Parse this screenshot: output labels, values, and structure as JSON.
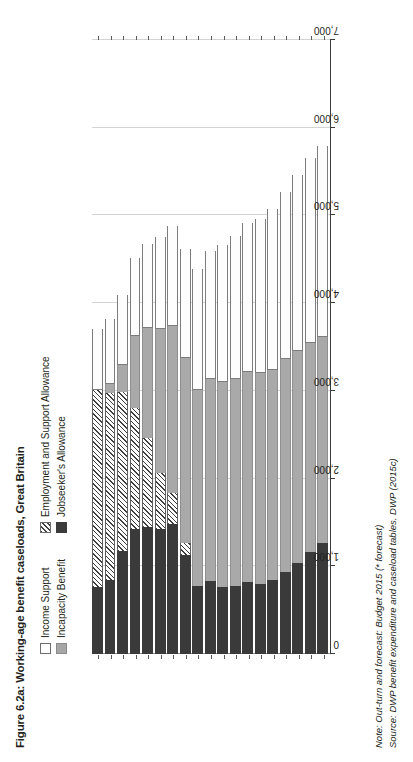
{
  "figure": {
    "title": "Figure 6.2a: Working-age benefit caseloads, Great Britain",
    "note": "Note: Out-turn and forecast: Budget 2015 (* forecast)",
    "source": "Source: DWP benefit expenditure and caseload tables. DWP (2015c)"
  },
  "legend": {
    "items": [
      {
        "label": "Income Support",
        "key": "income_support",
        "swatch": "white-box",
        "color": "#ffffff"
      },
      {
        "label": "Incapacity Benefit",
        "key": "incapacity",
        "swatch": "grey-box",
        "color": "#a6a6a6"
      },
      {
        "label": "Employment and Support Allowance",
        "key": "esa",
        "swatch": "hatched-box",
        "color": "#3f3f3f"
      },
      {
        "label": "Jobseeker's Allowance",
        "key": "jsa",
        "swatch": "black-box",
        "color": "#3b3b3b"
      }
    ]
  },
  "axis": {
    "value_ticks": [
      "0",
      "1,000",
      "2,000",
      "3,000",
      "4,000",
      "5,000",
      "6,000",
      "7,000"
    ],
    "value_min": 0,
    "value_max": 7000
  },
  "chart_data": {
    "type": "bar",
    "orientation": "horizontal-stacked",
    "title": "Figure 6.2a: Working-age benefit caseloads, Great Britain",
    "xlabel": "",
    "ylabel": "",
    "xlim": [
      0,
      7000
    ],
    "grid": true,
    "legend_position": "top",
    "units": "thousands of claimants",
    "categories": [
      "1997/98",
      "1998/99",
      "1999/00",
      "2000/01",
      "2001/02",
      "2002/03",
      "2003/04",
      "2004/05",
      "2005/06",
      "2006/07",
      "2007/08",
      "2008/09",
      "2009/10",
      "2010/11",
      "2011/12",
      "2012/13",
      "2013/14",
      "2014/15*",
      "2015/16*"
    ],
    "series": [
      {
        "name": "Jobseeker's Allowance",
        "values": [
          1260,
          1160,
          1040,
          940,
          840,
          800,
          820,
          770,
          760,
          830,
          770,
          1130,
          1480,
          1420,
          1450,
          1430,
          1170,
          840,
          760
        ]
      },
      {
        "name": "Employment and Support Allowance",
        "values": [
          0,
          0,
          0,
          0,
          0,
          0,
          0,
          0,
          0,
          0,
          0,
          140,
          360,
          640,
          1010,
          1370,
          1820,
          2130,
          2250
        ]
      },
      {
        "name": "Incapacity Benefit",
        "values": [
          2350,
          2390,
          2420,
          2420,
          2400,
          2400,
          2390,
          2370,
          2340,
          2300,
          2240,
          2100,
          1900,
          1640,
          1260,
          830,
          300,
          110,
          0
        ]
      },
      {
        "name": "Income Support",
        "values": [
          2180,
          2110,
          2000,
          1910,
          1830,
          1760,
          1700,
          1630,
          1560,
          1470,
          1380,
          1250,
          1140,
          1050,
          960,
          880,
          800,
          740,
          690
        ]
      }
    ],
    "stack_order": [
      "Jobseeker's Allowance",
      "Employment and Support Allowance",
      "Incapacity Benefit",
      "Income Support"
    ]
  }
}
